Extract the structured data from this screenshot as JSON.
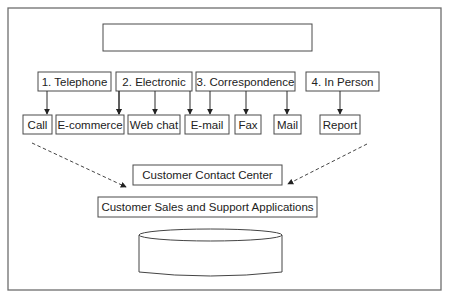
{
  "diagram": {
    "title_box": {
      "label": ""
    },
    "channels": [
      {
        "label": "1. Telephone",
        "x": 38,
        "w": 73,
        "targets": [
          0,
          1
        ]
      },
      {
        "label": "2. Electronic",
        "x": 116,
        "w": 76,
        "targets": [
          1,
          2,
          3
        ]
      },
      {
        "label": "3. Correspondence",
        "x": 196,
        "w": 99,
        "targets": [
          3,
          4,
          5
        ]
      },
      {
        "label": "4. In Person",
        "x": 306,
        "w": 73,
        "targets": [
          6
        ]
      }
    ],
    "touchpoints": [
      {
        "label": "Call",
        "x": 23,
        "w": 29
      },
      {
        "label": "E-commerce",
        "x": 56,
        "w": 68
      },
      {
        "label": "Web chat",
        "x": 128,
        "w": 52
      },
      {
        "label": "E-mail",
        "x": 185,
        "w": 44
      },
      {
        "label": "Fax",
        "x": 235,
        "w": 26
      },
      {
        "label": "Mail",
        "x": 274,
        "w": 27
      },
      {
        "label": "Report",
        "x": 320,
        "w": 40
      }
    ],
    "contact_center": {
      "label": "Customer Contact Center"
    },
    "applications": {
      "label": "Customer Sales and Support Applications"
    },
    "database": {
      "label": ""
    }
  }
}
